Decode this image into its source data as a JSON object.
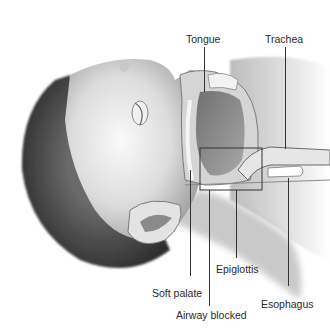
{
  "figure": {
    "labels": {
      "tongue": "Tongue",
      "trachea": "Trachea",
      "epiglottis": "Epiglottis",
      "soft_palate": "Soft palate",
      "airway_blocked": "Airway blocked",
      "esophagus": "Esophagus"
    },
    "colors": {
      "background": "#ffffff",
      "label_text": "#2a2a2a",
      "leader_line": "#333333",
      "skin_light": "#e8e8e8",
      "skin_mid": "#b5b5b5",
      "hair": "#4a4a4a",
      "tongue": "#8a8a8a"
    }
  }
}
